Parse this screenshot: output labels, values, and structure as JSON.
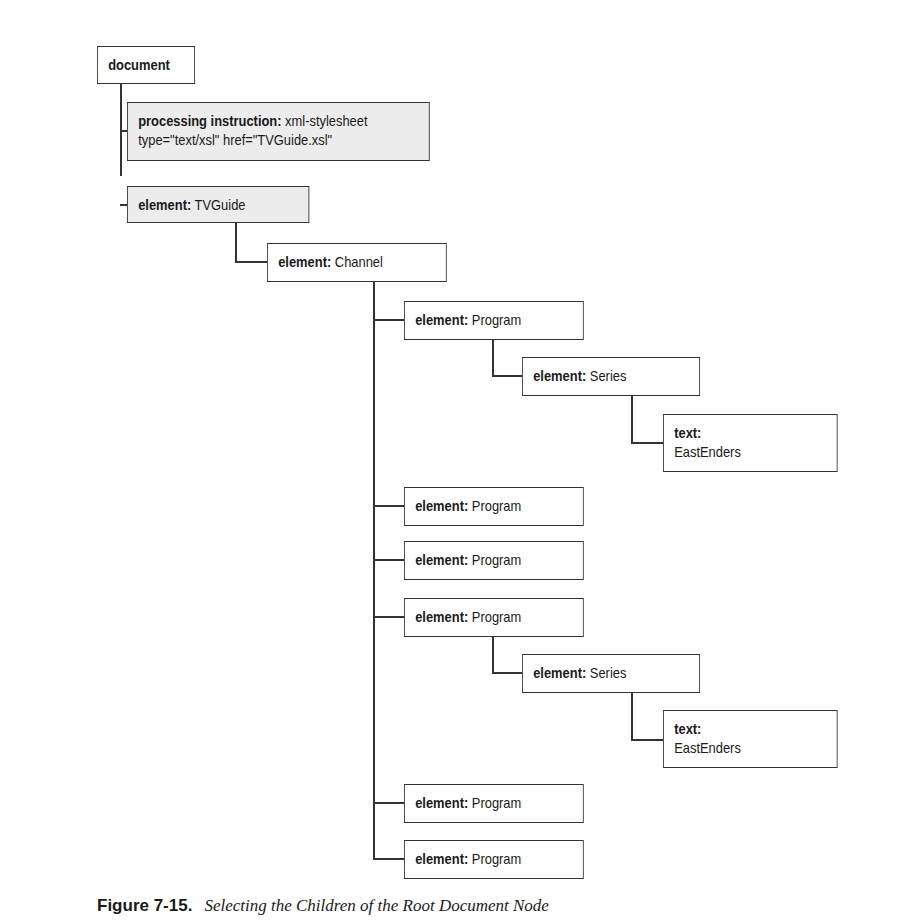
{
  "diagram": {
    "type": "tree",
    "nodes": {
      "document": {
        "kind": "document",
        "label": ""
      },
      "pi": {
        "kind": "processing instruction:",
        "label": " xml-stylesheet",
        "line2": "type=\"text/xsl\" href=\"TVGuide.xsl\"",
        "highlighted": true
      },
      "tvguide": {
        "kind": "element:",
        "label": " TVGuide",
        "highlighted": true
      },
      "channel": {
        "kind": "element:",
        "label": " Channel"
      },
      "program1": {
        "kind": "element:",
        "label": " Program"
      },
      "series1": {
        "kind": "element:",
        "label": " Series"
      },
      "text1": {
        "kind": "text:",
        "label": "EastEnders"
      },
      "program2": {
        "kind": "element:",
        "label": " Program"
      },
      "program3": {
        "kind": "element:",
        "label": " Program"
      },
      "program4": {
        "kind": "element:",
        "label": " Program"
      },
      "series2": {
        "kind": "element:",
        "label": " Series"
      },
      "text2": {
        "kind": "text:",
        "label": "EastEnders"
      },
      "program5": {
        "kind": "element:",
        "label": " Program"
      },
      "program6": {
        "kind": "element:",
        "label": " Program"
      }
    },
    "edges": [
      [
        "document",
        "pi"
      ],
      [
        "document",
        "tvguide"
      ],
      [
        "tvguide",
        "channel"
      ],
      [
        "channel",
        "program1"
      ],
      [
        "program1",
        "series1"
      ],
      [
        "series1",
        "text1"
      ],
      [
        "channel",
        "program2"
      ],
      [
        "channel",
        "program3"
      ],
      [
        "channel",
        "program4"
      ],
      [
        "program4",
        "series2"
      ],
      [
        "series2",
        "text2"
      ],
      [
        "channel",
        "program5"
      ],
      [
        "channel",
        "program6"
      ]
    ],
    "colors": {
      "line": "#333333",
      "highlight_fill": "#ececec",
      "fill": "#ffffff"
    }
  },
  "caption": {
    "figure_label": "Figure 7-15.",
    "title": "Selecting the Children of the Root Document Node"
  }
}
